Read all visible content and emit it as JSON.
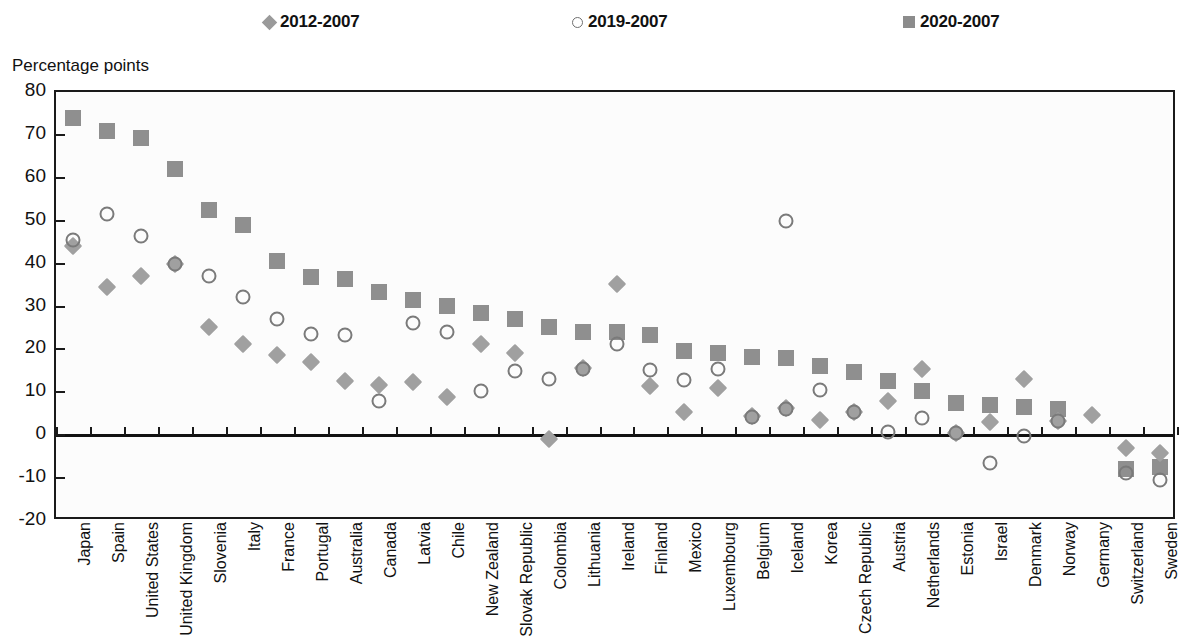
{
  "ylabel_text": "Percentage points",
  "legend": [
    {
      "label": "2012-2007",
      "marker": "diamond-marker",
      "color": "#9a9a9a"
    },
    {
      "label": "2019-2007",
      "marker": "open-circle-marker",
      "color": "#6f6f6f"
    },
    {
      "label": "2020-2007",
      "marker": "filled-square-marker",
      "color": "#8c8c8c"
    }
  ],
  "chart_data": {
    "type": "scatter",
    "title": "",
    "subtitle": "",
    "xlabel": "",
    "ylabel": "Percentage points",
    "ylim": [
      -20,
      80
    ],
    "ytick_labels": [
      "80",
      "70",
      "60",
      "50",
      "40",
      "30",
      "20",
      "10",
      "0",
      "-10",
      "-20"
    ],
    "yticks": [
      80,
      70,
      60,
      50,
      40,
      30,
      20,
      10,
      0,
      -10,
      -20
    ],
    "grid": false,
    "legend_position": "top",
    "categories": [
      "Japan",
      "Spain",
      "United States",
      "United Kingdom",
      "Slovenia",
      "Italy",
      "France",
      "Portugal",
      "Australia",
      "Canada",
      "Latvia",
      "Chile",
      "New Zealand",
      "Slovak Republic",
      "Colombia",
      "Lithuania",
      "Ireland",
      "Finland",
      "Mexico",
      "Luxembourg",
      "Belgium",
      "Iceland",
      "Korea",
      "Czech Republic",
      "Austria",
      "Netherlands",
      "Estonia",
      "Israel",
      "Denmark",
      "Norway",
      "Germany",
      "Switzerland",
      "Sweden"
    ],
    "series": [
      {
        "name": "2012-2007",
        "marker": "diamond",
        "color": "#a0a0a0",
        "values": [
          44.0,
          34.5,
          37.0,
          39.8,
          25.3,
          21.3,
          18.8,
          17.0,
          12.6,
          11.8,
          12.4,
          8.8,
          21.3,
          19.2,
          -1.0,
          15.6,
          35.2,
          11.5,
          5.5,
          11.1,
          4.4,
          6.3,
          3.6,
          5.3,
          7.9,
          15.4,
          0.6,
          3.0,
          13.0,
          3.3,
          4.7,
          -3.0,
          -4.2
        ]
      },
      {
        "name": "2019-2007",
        "marker": "open-circle",
        "color": "#7a7a7a",
        "values": [
          45.5,
          51.5,
          46.5,
          39.9,
          37.1,
          32.3,
          27.1,
          23.5,
          23.4,
          7.9,
          26.1,
          24.0,
          10.2,
          15.0,
          13.1,
          15.4,
          21.3,
          15.3,
          12.9,
          15.4,
          4.3,
          6.0,
          10.6,
          5.4,
          0.8,
          4.1,
          0.4,
          -6.5,
          -0.3,
          3.2,
          null,
          -8.9,
          -10.5
        ]
      },
      {
        "name": "2020-2007",
        "marker": "filled-square",
        "color": "#8f8f8f",
        "values": [
          74.0,
          71.0,
          69.3,
          62.0,
          52.6,
          49.1,
          40.5,
          36.9,
          36.5,
          33.3,
          31.4,
          30.1,
          28.6,
          27.1,
          25.3,
          24.1,
          24.0,
          23.3,
          19.7,
          19.1,
          18.2,
          18.0,
          16.1,
          14.7,
          12.6,
          10.3,
          7.6,
          7.1,
          6.6,
          6.0,
          null,
          -7.9,
          -7.5
        ]
      }
    ]
  },
  "extra_points": [
    {
      "name": "iceland-2019-outlier",
      "category": "Iceland",
      "series": "2019-2007",
      "value": 50.0
    }
  ]
}
